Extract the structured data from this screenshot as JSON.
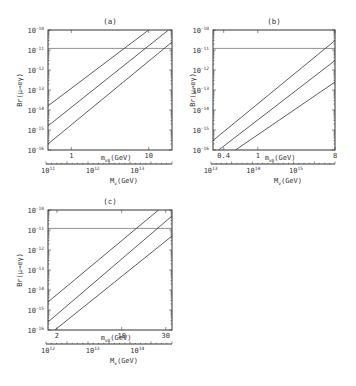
{
  "chart_data": [
    {
      "id": "a",
      "type": "line",
      "title": "(a)",
      "ylabel": "Br(μ→eγ)",
      "xlabel": "m_{ν0}(GeV)",
      "xlabel2": "M_{ν}(GeV)",
      "xscale": "log",
      "yscale": "log",
      "xlim": [
        0.5,
        20
      ],
      "ylim": [
        1e-16,
        1e-10
      ],
      "yticks": [
        {
          "label": "10",
          "exp": "-10",
          "value": 1e-10
        },
        {
          "label": "10",
          "exp": "-11",
          "value": 1e-11
        },
        {
          "label": "10",
          "exp": "-12",
          "value": 1e-12
        },
        {
          "label": "10",
          "exp": "-13",
          "value": 1e-13
        },
        {
          "label": "10",
          "exp": "-14",
          "value": 1e-14
        },
        {
          "label": "10",
          "exp": "-15",
          "value": 1e-15
        },
        {
          "label": "10",
          "exp": "-16",
          "value": 1e-16
        }
      ],
      "xticks": [
        {
          "label": "1",
          "value": 1
        },
        {
          "label": "10",
          "value": 10
        }
      ],
      "xticks2": [
        {
          "label": "10",
          "exp": "11",
          "frac": 0.0
        },
        {
          "label": "10",
          "exp": "12",
          "frac": 0.36
        },
        {
          "label": "10",
          "exp": "13",
          "frac": 0.72
        }
      ],
      "bound": {
        "label": "experimental bound",
        "value": 1.2e-11
      },
      "series": [
        {
          "name": "upper",
          "points": [
            [
              0.5,
              1.6e-14
            ],
            [
              10,
              1e-10
            ]
          ]
        },
        {
          "name": "middle",
          "points": [
            [
              0.5,
              1.6e-15
            ],
            [
              18,
              1e-10
            ]
          ]
        },
        {
          "name": "lower",
          "points": [
            [
              0.5,
              2e-16
            ],
            [
              20,
              2.5e-11
            ]
          ]
        }
      ]
    },
    {
      "id": "b",
      "type": "line",
      "title": "(b)",
      "ylabel": "Br(μ→eγ)",
      "xlabel": "m_{ν0}(GeV)",
      "xlabel2": "M_{ν}(GeV)",
      "xscale": "log",
      "yscale": "log",
      "xlim": [
        0.3,
        8
      ],
      "ylim": [
        1e-16,
        1e-10
      ],
      "yticks": [
        {
          "label": "10",
          "exp": "-10",
          "value": 1e-10
        },
        {
          "label": "10",
          "exp": "-11",
          "value": 1e-11
        },
        {
          "label": "10",
          "exp": "-12",
          "value": 1e-12
        },
        {
          "label": "10",
          "exp": "-13",
          "value": 1e-13
        },
        {
          "label": "10",
          "exp": "-14",
          "value": 1e-14
        },
        {
          "label": "10",
          "exp": "-15",
          "value": 1e-15
        },
        {
          "label": "10",
          "exp": "-16",
          "value": 1e-16
        }
      ],
      "xticks": [
        {
          "label": "0.4",
          "value": 0.4
        },
        {
          "label": "1",
          "value": 1
        },
        {
          "label": "8",
          "value": 8
        }
      ],
      "xticks2": [
        {
          "label": "10",
          "exp": "13",
          "frac": -0.02
        },
        {
          "label": "10",
          "exp": "14",
          "frac": 0.33
        },
        {
          "label": "10",
          "exp": "15",
          "frac": 0.68
        }
      ],
      "bound": {
        "label": "experimental bound",
        "value": 1.2e-11
      },
      "series": [
        {
          "name": "upper",
          "points": [
            [
              0.3,
              3e-16
            ],
            [
              8,
              3e-11
            ]
          ]
        },
        {
          "name": "middle",
          "points": [
            [
              0.35,
              1e-16
            ],
            [
              8,
              3e-12
            ]
          ]
        },
        {
          "name": "lower",
          "points": [
            [
              0.55,
              1e-16
            ],
            [
              8,
              2.5e-13
            ]
          ]
        }
      ]
    },
    {
      "id": "c",
      "type": "line",
      "title": "(c)",
      "ylabel": "Br(μ→eγ)",
      "xlabel": "m_{ν0}(GeV)",
      "xlabel2": "M_{ν}(GeV)",
      "xscale": "log",
      "yscale": "log",
      "xlim": [
        1.6,
        35
      ],
      "ylim": [
        1e-16,
        1e-10
      ],
      "yticks": [
        {
          "label": "10",
          "exp": "-10",
          "value": 1e-10
        },
        {
          "label": "10",
          "exp": "-11",
          "value": 1e-11
        },
        {
          "label": "10",
          "exp": "-12",
          "value": 1e-12
        },
        {
          "label": "10",
          "exp": "-13",
          "value": 1e-13
        },
        {
          "label": "10",
          "exp": "-14",
          "value": 1e-14
        },
        {
          "label": "10",
          "exp": "-15",
          "value": 1e-15
        },
        {
          "label": "10",
          "exp": "-16",
          "value": 1e-16
        }
      ],
      "xticks": [
        {
          "label": "2",
          "value": 2
        },
        {
          "label": "10",
          "value": 10
        },
        {
          "label": "30",
          "value": 30
        }
      ],
      "xticks2": [
        {
          "label": "10",
          "exp": "12",
          "frac": 0.0
        },
        {
          "label": "10",
          "exp": "13",
          "frac": 0.36
        },
        {
          "label": "10",
          "exp": "14",
          "frac": 0.72
        }
      ],
      "bound": {
        "label": "experimental bound",
        "value": 1.2e-11
      },
      "series": [
        {
          "name": "upper",
          "points": [
            [
              1.6,
              2.5e-15
            ],
            [
              25,
              1e-10
            ]
          ]
        },
        {
          "name": "middle",
          "points": [
            [
              1.6,
              2.5e-16
            ],
            [
              35,
              5e-11
            ]
          ]
        },
        {
          "name": "lower",
          "points": [
            [
              1.9,
              1e-16
            ],
            [
              35,
              5e-12
            ]
          ]
        }
      ]
    }
  ]
}
